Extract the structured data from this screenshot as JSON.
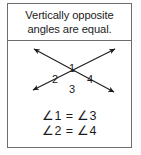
{
  "card": {
    "header": {
      "title": "Vertically opposite angles are equal."
    },
    "figure": {
      "description": "Two straight lines crossing to form an X with arrowheads on all four ends",
      "labels": [
        {
          "id": "1",
          "text": "1",
          "position": "top"
        },
        {
          "id": "2",
          "text": "2",
          "position": "left"
        },
        {
          "id": "3",
          "text": "3",
          "position": "bottom"
        },
        {
          "id": "4",
          "text": "4",
          "position": "right"
        }
      ]
    },
    "equations": [
      {
        "text": "∠1  =  ∠3"
      },
      {
        "text": "∠2  =  ∠4"
      }
    ]
  },
  "colors": {
    "border": "#6d6d6d",
    "ink": "#1c1c1c",
    "background": "#ffffff"
  }
}
